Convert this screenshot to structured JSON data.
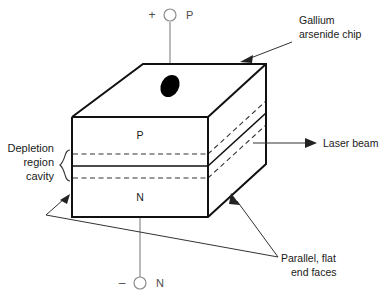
{
  "figure": {
    "background_color": "#ffffff",
    "line_color": "#111111",
    "lead_color": "#8c8c8c"
  },
  "terminals": {
    "top": {
      "sign": "+",
      "label": "P",
      "name": "p-terminal"
    },
    "bottom": {
      "sign": "–",
      "label": "N",
      "name": "n-terminal"
    }
  },
  "layers": {
    "upper": "P",
    "lower": "N"
  },
  "callouts": {
    "chip": {
      "line1": "Gallium",
      "line2": "arsenide chip"
    },
    "beam": {
      "line1": "Laser beam"
    },
    "faces": {
      "line1": "Parallel, flat",
      "line2": "end faces"
    }
  },
  "region_label": {
    "line1": "Depletion",
    "line2": "region",
    "line3": "cavity"
  }
}
